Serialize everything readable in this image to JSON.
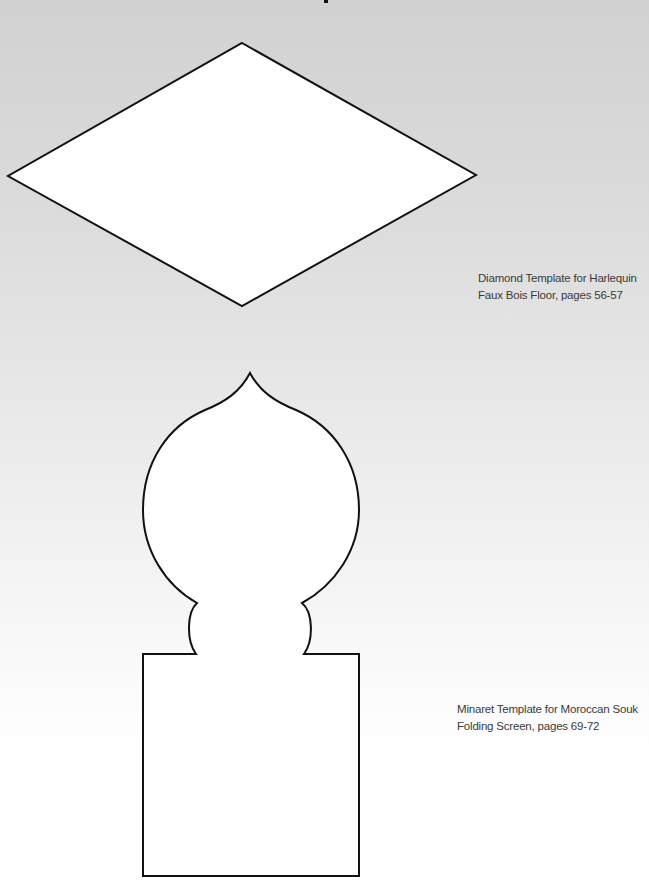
{
  "templates": [
    {
      "id": "diamond",
      "caption_lines": [
        "Diamond Template for Harlequin",
        "Faux Bois Floor, pages 56-57"
      ]
    },
    {
      "id": "minaret",
      "caption_lines": [
        "Minaret Template for Moroccan Souk",
        "Folding Screen, pages 69-72"
      ]
    }
  ],
  "colors": {
    "outline": "#111111",
    "fill": "#ffffff",
    "background_top": "#d1d1d1",
    "background_bottom": "#ffffff",
    "caption_text": "#3a3a3a"
  }
}
